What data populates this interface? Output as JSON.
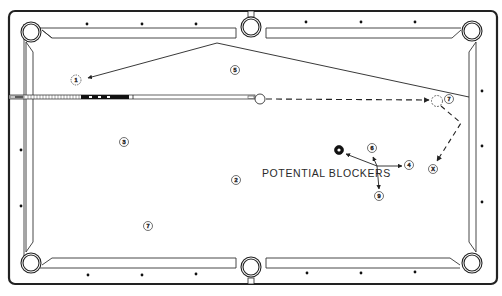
{
  "diagram": {
    "type": "pool-table-shot-diagram",
    "annotation": "POTENTIAL BLOCKERS",
    "colors": {
      "line": "#222222",
      "background": "#ffffff",
      "object_ball_8": "#111111"
    },
    "balls": [
      {
        "id": "ghost-1",
        "label": "1",
        "x": 76,
        "y": 80,
        "style": "dashed-ghost"
      },
      {
        "id": "ball-5",
        "label": "5",
        "x": 235,
        "y": 70
      },
      {
        "id": "ball-3",
        "label": "3",
        "x": 124,
        "y": 142
      },
      {
        "id": "ball-2",
        "label": "2",
        "x": 236,
        "y": 180
      },
      {
        "id": "ball-7-table",
        "label": "7",
        "x": 148,
        "y": 226
      },
      {
        "id": "cue-ball",
        "label": "",
        "x": 260,
        "y": 98,
        "style": "cue-ball"
      },
      {
        "id": "ghost-cue",
        "label": "",
        "x": 437,
        "y": 101,
        "style": "dashed-ghost"
      },
      {
        "id": "ball-7-target",
        "label": "7",
        "x": 449,
        "y": 99
      },
      {
        "id": "ball-6",
        "label": "6",
        "x": 372,
        "y": 148
      },
      {
        "id": "ball-8",
        "label": "8",
        "x": 339,
        "y": 150,
        "style": "black"
      },
      {
        "id": "ball-4",
        "label": "4",
        "x": 409,
        "y": 165
      },
      {
        "id": "ball-9",
        "label": "9",
        "x": 379,
        "y": 196
      },
      {
        "id": "ball-x",
        "label": "X",
        "x": 433,
        "y": 169
      }
    ],
    "paths": {
      "cue_ball_path": "dashed from cue ball to ghost ball near 7",
      "cue_ball_deflection": "dashed from ghost ball off right rail to X",
      "object_ball_path": "solid from 7 off top rail near side pocket to ghost 1"
    },
    "rail_diamonds": {
      "top": [
        87,
        142,
        196,
        306,
        361,
        415
      ],
      "bottom": [
        87,
        142,
        196,
        306,
        361,
        415
      ],
      "left": [
        149,
        206
      ],
      "right": [
        90,
        146,
        202
      ]
    }
  }
}
